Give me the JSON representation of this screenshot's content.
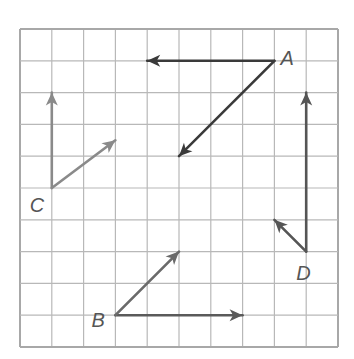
{
  "grid": {
    "columns": 10,
    "rows": 10,
    "origin_px": [
      20,
      29
    ],
    "cell_px": 31.8,
    "line_color": "#b8b8b8",
    "border_color": "#a8a8a8"
  },
  "vectors": [
    {
      "id": "A-left",
      "from": [
        8,
        1
      ],
      "to": [
        4,
        1
      ],
      "color": "#3a3a3a"
    },
    {
      "id": "A-diag",
      "from": [
        8,
        1
      ],
      "to": [
        5,
        4
      ],
      "color": "#3a3a3a"
    },
    {
      "id": "B-right",
      "from": [
        3,
        9
      ],
      "to": [
        7,
        9
      ],
      "color": "#5a5a5a"
    },
    {
      "id": "B-diag",
      "from": [
        3,
        9
      ],
      "to": [
        5,
        7
      ],
      "color": "#6a6a6a"
    },
    {
      "id": "C-up",
      "from": [
        1,
        5
      ],
      "to": [
        1,
        2
      ],
      "color": "#8a8a8a"
    },
    {
      "id": "C-diag",
      "from": [
        1,
        5
      ],
      "to": [
        3,
        3.5
      ],
      "color": "#8a8a8a"
    },
    {
      "id": "D-up",
      "from": [
        9,
        7
      ],
      "to": [
        9,
        2
      ],
      "color": "#555555"
    },
    {
      "id": "D-diag",
      "from": [
        9,
        7
      ],
      "to": [
        8,
        6
      ],
      "color": "#555555"
    }
  ],
  "points": [
    {
      "label": "A",
      "pos": [
        8,
        1
      ],
      "offset": [
        6,
        4
      ]
    },
    {
      "label": "B",
      "pos": [
        3,
        9
      ],
      "offset": [
        -24,
        12
      ]
    },
    {
      "label": "C",
      "pos": [
        1,
        5
      ],
      "offset": [
        -22,
        24
      ]
    },
    {
      "label": "D",
      "pos": [
        9,
        7
      ],
      "offset": [
        -10,
        28
      ]
    }
  ]
}
